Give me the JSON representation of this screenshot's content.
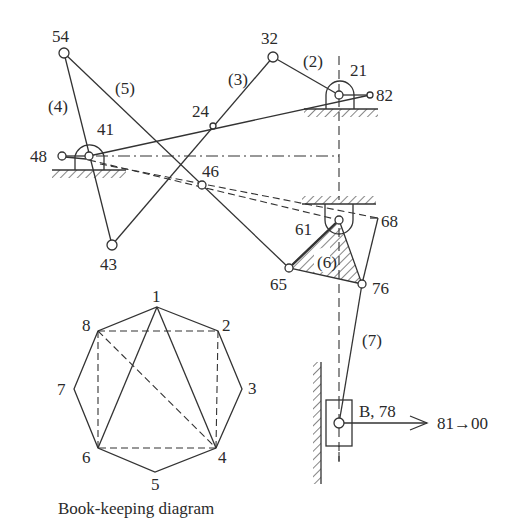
{
  "mechanism": {
    "joints": {
      "j54": "54",
      "j32": "32",
      "j21": "21",
      "j82": "82",
      "j24": "24",
      "j41": "41",
      "j48": "48",
      "j46": "46",
      "j43": "43",
      "j61": "61",
      "j68": "68",
      "j65": "65",
      "j76": "76",
      "j78": "B, 78"
    },
    "links": {
      "l2": "(2)",
      "l3": "(3)",
      "l4": "(4)",
      "l5": "(5)",
      "l6": "(6)",
      "l7": "(7)"
    },
    "output_arrow": "81→00"
  },
  "bookkeeping": {
    "caption": "Book-keeping diagram",
    "vertices": [
      "1",
      "2",
      "3",
      "4",
      "5",
      "6",
      "7",
      "8"
    ],
    "solid_edges": [
      [
        "1",
        "2"
      ],
      [
        "2",
        "3"
      ],
      [
        "3",
        "4"
      ],
      [
        "4",
        "5"
      ],
      [
        "5",
        "6"
      ],
      [
        "6",
        "7"
      ],
      [
        "7",
        "8"
      ],
      [
        "8",
        "1"
      ],
      [
        "1",
        "6"
      ],
      [
        "1",
        "4"
      ]
    ],
    "dashed_edges": [
      [
        "8",
        "2"
      ],
      [
        "2",
        "4"
      ],
      [
        "4",
        "6"
      ],
      [
        "6",
        "8"
      ],
      [
        "8",
        "4"
      ]
    ]
  }
}
